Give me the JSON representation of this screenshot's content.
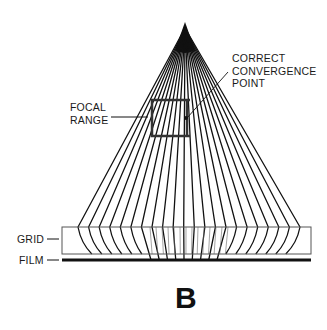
{
  "figure": {
    "panel_letter": "B",
    "labels": {
      "focal_range": [
        "FOCAL",
        "RANGE"
      ],
      "convergence_point": [
        "CORRECT",
        "CONVERGENCE",
        "POINT"
      ],
      "grid": "GRID",
      "film": "FILM"
    },
    "colors": {
      "ink": "#111111",
      "grid_outline": "#555555",
      "background": "#ffffff"
    },
    "geometry": {
      "apex": [
        185,
        22
      ],
      "grid_box": {
        "x": 62,
        "y": 227,
        "w": 249,
        "h": 27
      },
      "film_line": {
        "x1": 62,
        "x2": 311,
        "y": 260
      },
      "focal_rect": {
        "x": 152,
        "y": 100,
        "w": 35,
        "h": 36
      },
      "ray_count": 22
    }
  }
}
